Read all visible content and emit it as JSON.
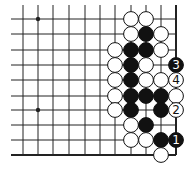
{
  "diagram": {
    "type": "go-board-fragment",
    "colors": {
      "background": "#ffffff",
      "line": "#222222",
      "black": "#111111",
      "white": "#ffffff"
    },
    "grid": {
      "cols_x": [
        23,
        38,
        53,
        69,
        85,
        100,
        115,
        131,
        146,
        161,
        176
      ],
      "rows_y": [
        19,
        34,
        50,
        65,
        80,
        96,
        110,
        125,
        140,
        155
      ],
      "left_extend": 12,
      "top_extend": 14,
      "right_edge": true,
      "bottom_edge": true
    },
    "star_points": [
      {
        "col": 1,
        "row": 0
      },
      {
        "col": 1,
        "row": 6
      }
    ],
    "stones": [
      {
        "col": 7,
        "row": 0,
        "color": "white"
      },
      {
        "col": 8,
        "row": 0,
        "color": "white"
      },
      {
        "col": 7,
        "row": 1,
        "color": "white"
      },
      {
        "col": 8,
        "row": 1,
        "color": "black"
      },
      {
        "col": 9,
        "row": 1,
        "color": "white"
      },
      {
        "col": 6,
        "row": 2,
        "color": "white"
      },
      {
        "col": 7,
        "row": 2,
        "color": "black"
      },
      {
        "col": 8,
        "row": 2,
        "color": "black"
      },
      {
        "col": 9,
        "row": 2,
        "color": "white"
      },
      {
        "col": 6,
        "row": 3,
        "color": "white"
      },
      {
        "col": 7,
        "row": 3,
        "color": "black"
      },
      {
        "col": 8,
        "row": 3,
        "color": "white"
      },
      {
        "col": 10,
        "row": 3,
        "color": "black",
        "label": "3"
      },
      {
        "col": 6,
        "row": 4,
        "color": "white"
      },
      {
        "col": 7,
        "row": 4,
        "color": "black"
      },
      {
        "col": 8,
        "row": 4,
        "color": "white"
      },
      {
        "col": 9,
        "row": 4,
        "color": "white"
      },
      {
        "col": 10,
        "row": 4,
        "color": "white",
        "label": "4"
      },
      {
        "col": 6,
        "row": 5,
        "color": "white"
      },
      {
        "col": 7,
        "row": 5,
        "color": "black"
      },
      {
        "col": 8,
        "row": 5,
        "color": "black"
      },
      {
        "col": 9,
        "row": 5,
        "color": "black"
      },
      {
        "col": 10,
        "row": 5,
        "color": "white"
      },
      {
        "col": 6,
        "row": 6,
        "color": "white"
      },
      {
        "col": 7,
        "row": 6,
        "color": "black"
      },
      {
        "col": 9,
        "row": 6,
        "color": "black"
      },
      {
        "col": 10,
        "row": 6,
        "color": "white",
        "label": "2"
      },
      {
        "col": 7,
        "row": 7,
        "color": "white"
      },
      {
        "col": 8,
        "row": 7,
        "color": "black"
      },
      {
        "col": 7,
        "row": 8,
        "color": "white"
      },
      {
        "col": 8,
        "row": 8,
        "color": "white"
      },
      {
        "col": 9,
        "row": 8,
        "color": "black"
      },
      {
        "col": 10,
        "row": 8,
        "color": "black",
        "label": "1"
      },
      {
        "col": 9,
        "row": 9,
        "color": "white"
      }
    ]
  }
}
